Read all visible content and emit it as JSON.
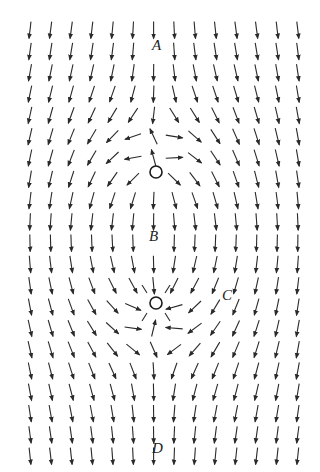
{
  "diagram": {
    "type": "vector_field",
    "colors": {
      "arrow": "#2a2a2a",
      "background": "#ffffff",
      "circle": "#1a1a1a"
    },
    "grid": {
      "cols": 14,
      "rows": 21,
      "x0": 22,
      "y0": 22,
      "dx": 20.6,
      "dy": 21.3,
      "arrow_len": 17
    },
    "uniform_flow": {
      "vx": 0,
      "vy": 1.0
    },
    "source": {
      "name": "source-circle",
      "x": 156,
      "y": 172,
      "r": 6,
      "strength": 1.0
    },
    "sink": {
      "name": "sink-circle",
      "x": 156,
      "y": 303,
      "r": 6,
      "strength": -1.0
    },
    "labels": [
      {
        "id": "A",
        "text": "A",
        "x": 152,
        "y": 38
      },
      {
        "id": "B",
        "text": "B",
        "x": 149,
        "y": 229
      },
      {
        "id": "C",
        "text": "C",
        "x": 222,
        "y": 288
      },
      {
        "id": "D",
        "text": "D",
        "x": 152,
        "y": 441
      }
    ]
  }
}
